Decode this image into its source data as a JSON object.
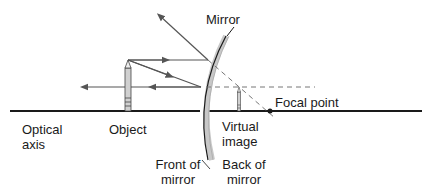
{
  "diagram": {
    "labels": {
      "mirror": "Mirror",
      "focal_point": "Focal point",
      "optical_axis_line1": "Optical",
      "optical_axis_line2": "axis",
      "object": "Object",
      "virtual_image_line1": "Virtual",
      "virtual_image_line2": "image",
      "front_line1": "Front of",
      "front_line2": "mirror",
      "back_line1": "Back of",
      "back_line2": "mirror"
    },
    "colors": {
      "line": "#1a1a1a",
      "ray": "#555555",
      "dashed": "#777777",
      "mirror_back": "#c8c8c8",
      "pencil_fill": "#d0d0d0"
    }
  }
}
